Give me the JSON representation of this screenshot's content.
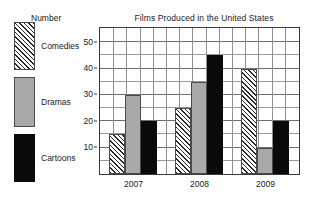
{
  "chart_data": {
    "type": "bar",
    "title": "Films Produced in the United States",
    "xlabel": "",
    "ylabel": "Number",
    "categories": [
      "2007",
      "2008",
      "2009"
    ],
    "series": [
      {
        "name": "Comedies",
        "values": [
          15,
          25,
          40
        ],
        "pattern": "diagonal-hatch",
        "color": "#ffffff"
      },
      {
        "name": "Dramas",
        "values": [
          30,
          35,
          10
        ],
        "pattern": "solid",
        "color": "#a9a9a9"
      },
      {
        "name": "Cartoons",
        "values": [
          20,
          45,
          20
        ],
        "pattern": "solid",
        "color": "#0a0a0a"
      }
    ],
    "ylim": [
      0,
      55
    ],
    "yticks": [
      10,
      20,
      30,
      40,
      50
    ],
    "ytick_labels": [
      "10",
      "20",
      "30",
      "40",
      "50"
    ],
    "y_minor_step": 5,
    "grid": true,
    "legend_position": "left-outside"
  },
  "legend": {
    "items": [
      {
        "label": "Comedies",
        "swatch": "hatch-swatch"
      },
      {
        "label": "Dramas",
        "swatch": "gray-swatch"
      },
      {
        "label": "Cartoons",
        "swatch": "black-swatch"
      }
    ]
  },
  "axes": {
    "y_caption": "Number",
    "y_tick_labels": [
      "50",
      "40",
      "30",
      "20",
      "10"
    ],
    "x_tick_labels": [
      "2007",
      "2008",
      "2009"
    ]
  }
}
